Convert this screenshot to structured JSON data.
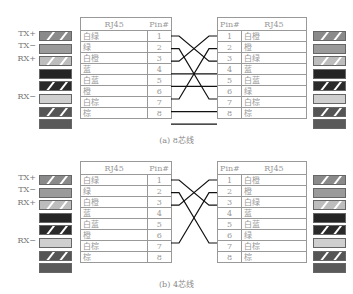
{
  "diagrams": [
    {
      "caption": "(a) 8芯线",
      "signal_labels": [
        "TX+",
        "TX−",
        "RX+",
        "",
        "",
        "RX−",
        "",
        ""
      ],
      "left_table": {
        "headers": [
          "RJ45",
          "Pin#"
        ],
        "rows": [
          {
            "color": "白绿",
            "pin": "1"
          },
          {
            "color": "绿",
            "pin": "2"
          },
          {
            "color": "白橙",
            "pin": "3"
          },
          {
            "color": "蓝",
            "pin": "4"
          },
          {
            "color": "白蓝",
            "pin": "5"
          },
          {
            "color": "橙",
            "pin": "6"
          },
          {
            "color": "白棕",
            "pin": "7"
          },
          {
            "color": "棕",
            "pin": "8"
          }
        ]
      },
      "right_table": {
        "headers": [
          "Pin#",
          "RJ45"
        ],
        "rows": [
          {
            "pin": "1",
            "color": "白橙"
          },
          {
            "pin": "2",
            "color": "橙"
          },
          {
            "pin": "3",
            "color": "白绿"
          },
          {
            "pin": "4",
            "color": "蓝"
          },
          {
            "pin": "5",
            "color": "白蓝"
          },
          {
            "pin": "6",
            "color": "绿"
          },
          {
            "pin": "7",
            "color": "白棕"
          },
          {
            "pin": "8",
            "color": "棕"
          }
        ]
      },
      "connections": [
        [
          1,
          3
        ],
        [
          2,
          6
        ],
        [
          3,
          1
        ],
        [
          4,
          4
        ],
        [
          5,
          5
        ],
        [
          6,
          2
        ],
        [
          7,
          7
        ],
        [
          8,
          8
        ]
      ]
    },
    {
      "caption": "(b) 4芯线",
      "signal_labels": [
        "TX+",
        "TX−",
        "RX+",
        "",
        "",
        "RX−",
        "",
        ""
      ],
      "left_table": {
        "headers": [
          "RJ45",
          "Pin#"
        ],
        "rows": [
          {
            "color": "白绿",
            "pin": "1"
          },
          {
            "color": "绿",
            "pin": "2"
          },
          {
            "color": "白橙",
            "pin": "3"
          },
          {
            "color": "蓝",
            "pin": "4"
          },
          {
            "color": "白蓝",
            "pin": "5"
          },
          {
            "color": "橙",
            "pin": "6"
          },
          {
            "color": "白棕",
            "pin": "7"
          },
          {
            "color": "棕",
            "pin": "8"
          }
        ]
      },
      "right_table": {
        "headers": [
          "Pin#",
          "RJ45"
        ],
        "rows": [
          {
            "pin": "1",
            "color": "白橙"
          },
          {
            "pin": "2",
            "color": "橙"
          },
          {
            "pin": "3",
            "color": "白绿"
          },
          {
            "pin": "4",
            "color": "蓝"
          },
          {
            "pin": "5",
            "color": "白蓝"
          },
          {
            "pin": "6",
            "color": "绿"
          },
          {
            "pin": "7",
            "color": "白棕"
          },
          {
            "pin": "8",
            "color": "棕"
          }
        ]
      },
      "connections": [
        [
          1,
          3
        ],
        [
          2,
          6
        ],
        [
          3,
          1
        ],
        [
          6,
          2
        ]
      ]
    }
  ],
  "swatches": {
    "left": [
      {
        "fill": "#8a8a8a",
        "striped": true
      },
      {
        "fill": "#9a9a9a",
        "striped": false
      },
      {
        "fill": "#bdbdbd",
        "striped": true
      },
      {
        "fill": "#252525",
        "striped": false
      },
      {
        "fill": "#2a2a2a",
        "striped": true
      },
      {
        "fill": "#cfcfcf",
        "striped": false
      },
      {
        "fill": "#555555",
        "striped": true
      },
      {
        "fill": "#5a5a5a",
        "striped": false
      }
    ],
    "right": [
      {
        "fill": "#8a8a8a",
        "striped": true
      },
      {
        "fill": "#9a9a9a",
        "striped": false
      },
      {
        "fill": "#bdbdbd",
        "striped": true
      },
      {
        "fill": "#252525",
        "striped": false
      },
      {
        "fill": "#2a2a2a",
        "striped": true
      },
      {
        "fill": "#cfcfcf",
        "striped": false
      },
      {
        "fill": "#555555",
        "striped": true
      },
      {
        "fill": "#5a5a5a",
        "striped": false
      }
    ]
  }
}
